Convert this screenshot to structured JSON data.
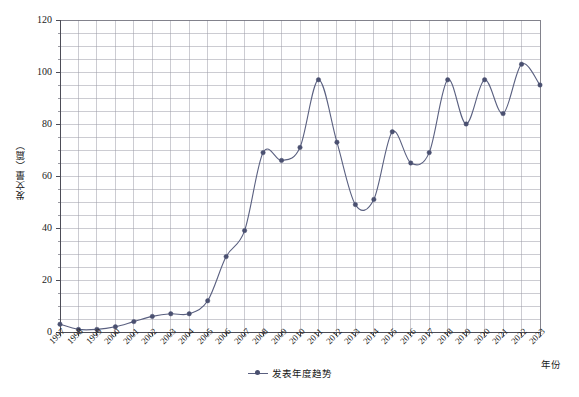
{
  "chart_data": {
    "type": "line",
    "title": "",
    "xlabel": "年份",
    "ylabel": "发文量（篇）",
    "legend": [
      "发表年度趋势"
    ],
    "legend_position": "bottom-center",
    "grid": true,
    "xlim": [
      1997,
      2023
    ],
    "ylim": [
      0,
      120
    ],
    "ytick_step": 20,
    "yminor_step": 5,
    "yticks": [
      0,
      20,
      40,
      60,
      80,
      100,
      120
    ],
    "categories": [
      "1997",
      "1998",
      "1999",
      "2000",
      "2001",
      "2002",
      "2003",
      "2004",
      "2005",
      "2006",
      "2007",
      "2008",
      "2009",
      "2010",
      "2011",
      "2012",
      "2013",
      "2014",
      "2015",
      "2016",
      "2017",
      "2018",
      "2019",
      "2020",
      "2021",
      "2022",
      "2023"
    ],
    "series": [
      {
        "name": "发表年度趋势",
        "color": "#5a6080",
        "marker_color": "#4a5070",
        "values": [
          3,
          1,
          1,
          2,
          4,
          6,
          7,
          7,
          12,
          29,
          39,
          69,
          66,
          71,
          97,
          73,
          49,
          51,
          77,
          65,
          69,
          97,
          80,
          97,
          84,
          103,
          95
        ]
      }
    ]
  },
  "axis": {
    "y_title": "发文量（篇）",
    "x_title": "年份"
  },
  "legend": {
    "entries": [
      {
        "label": "发表年度趋势",
        "marker": "line-with-dot-marker"
      }
    ]
  }
}
